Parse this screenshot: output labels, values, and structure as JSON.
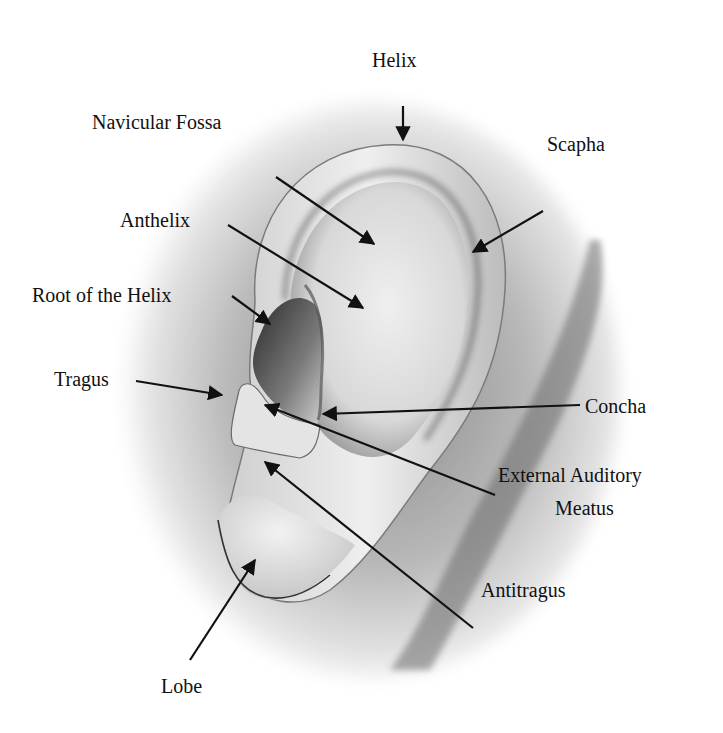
{
  "diagram": {
    "type": "anatomical-labeled-illustration",
    "colors": {
      "background": "#ffffff",
      "skin_light": "#f2f2f2",
      "skin_mid": "#bdbdbd",
      "skin_dark": "#3a3a3a",
      "arrow": "#111111",
      "text": "#111111"
    },
    "labels": [
      {
        "id": "helix",
        "text": "Helix"
      },
      {
        "id": "navicular-fossa",
        "text": "Navicular Fossa"
      },
      {
        "id": "scapha",
        "text": "Scapha"
      },
      {
        "id": "anthelix",
        "text": "Anthelix"
      },
      {
        "id": "root-of-helix",
        "text": "Root of the Helix"
      },
      {
        "id": "tragus",
        "text": "Tragus"
      },
      {
        "id": "concha",
        "text": "Concha"
      },
      {
        "id": "external-auditory-meatus",
        "text": "External Auditory",
        "text2": "Meatus"
      },
      {
        "id": "antitragus",
        "text": "Antitragus"
      },
      {
        "id": "lobe",
        "text": "Lobe"
      }
    ]
  }
}
